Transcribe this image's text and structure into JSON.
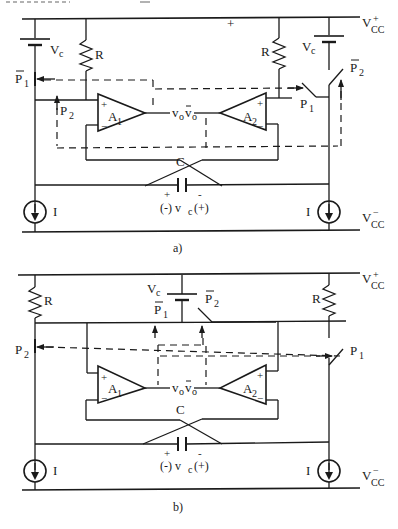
{
  "header_fragment": "… (partially cropped caption text at top)",
  "diagram_a": {
    "caption": "a)",
    "supply_pos": "V",
    "supply_pos_sub": "CC",
    "supply_pos_sup": "+",
    "supply_neg": "V",
    "supply_neg_sub": "CC",
    "supply_neg_sup": "−",
    "battery_left": "V",
    "battery_left_sub": "c",
    "battery_right": "V",
    "battery_right_sub": "c",
    "resistor_left": "R",
    "resistor_right": "R",
    "switch_p1bar": "P",
    "switch_p1bar_sub": "1",
    "switch_p2_left": "P",
    "switch_p2_left_sub": "2",
    "switch_p1_right": "P",
    "switch_p1_right_sub": "1",
    "switch_p2bar_right": "P",
    "switch_p2bar_right_sub": "2",
    "opamp_1": "A",
    "opamp_1_sub": "1",
    "opamp_2": "A",
    "opamp_2_sub": "2",
    "out_vo": "v",
    "out_vo_sub": "o",
    "out_vobar": "v",
    "out_vobar_sub": "o",
    "capacitor": "C",
    "cap_plus": "+",
    "cap_minus": "-",
    "cap_voltage": "(-) v",
    "cap_voltage_sub": "c",
    "cap_voltage_end": "(+)",
    "current_left": "I",
    "current_right": "I"
  },
  "diagram_b": {
    "caption": "b)",
    "supply_pos": "V",
    "supply_pos_sub": "CC",
    "supply_pos_sup": "+",
    "supply_neg": "V",
    "supply_neg_sub": "CC",
    "supply_neg_sup": "−",
    "battery": "V",
    "battery_sub": "c",
    "resistor_left": "R",
    "resistor_right": "R",
    "switch_p1bar": "P",
    "switch_p1bar_sub": "1",
    "switch_p2bar": "P",
    "switch_p2bar_sub": "2",
    "switch_p2_left": "P",
    "switch_p2_left_sub": "2",
    "switch_p1_right": "P",
    "switch_p1_right_sub": "1",
    "opamp_1": "A",
    "opamp_1_sub": "1",
    "opamp_2": "A",
    "opamp_2_sub": "2",
    "out_vo": "v",
    "out_vo_sub": "o",
    "out_vobar": "v",
    "out_vobar_sub": "o",
    "capacitor": "C",
    "cap_plus": "+",
    "cap_minus": "-",
    "cap_voltage": "(-) v",
    "cap_voltage_sub": "c",
    "cap_voltage_end": "(+)",
    "current_left": "I",
    "current_right": "I"
  }
}
